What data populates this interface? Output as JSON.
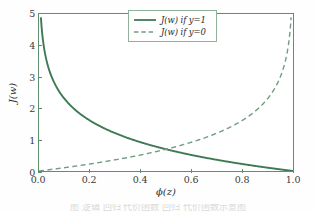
{
  "figure": {
    "background_color": "#fefefe",
    "accent_color": "#3f7a55",
    "frame_color": "#5f8f6f"
  },
  "axes": {
    "x_title": "ϕ(z)",
    "y_title": "J(w)",
    "x_tick_labels": [
      "0.0",
      "0.2",
      "0.4",
      "0.6",
      "0.8",
      "1.0"
    ],
    "y_tick_labels": [
      "0",
      "1",
      "2",
      "3",
      "4",
      "5"
    ]
  },
  "legend": {
    "entries": [
      {
        "label": "J(w) if y=1",
        "style": "solid"
      },
      {
        "label": "J(w) if y=0",
        "style": "dashed"
      }
    ]
  },
  "caption": {
    "text": "图    逻辑   回归   代价函数   回归   代价函数示意图"
  },
  "chart_data": {
    "type": "line",
    "title": "",
    "xlabel": "ϕ(z)",
    "ylabel": "J(w)",
    "xlim": [
      0.0,
      1.0
    ],
    "ylim": [
      0.0,
      5.0
    ],
    "xticks": [
      0.0,
      0.2,
      0.4,
      0.6,
      0.8,
      1.0
    ],
    "yticks": [
      0,
      1,
      2,
      3,
      4,
      5
    ],
    "grid": false,
    "legend_position": "upper center",
    "series": [
      {
        "name": "J(w) if y=1",
        "style": "solid",
        "color": "#3f7a55",
        "formula": "-log(phi(z))",
        "x": [
          0.007,
          0.02,
          0.04,
          0.06,
          0.08,
          0.1,
          0.12,
          0.15,
          0.2,
          0.25,
          0.3,
          0.35,
          0.4,
          0.45,
          0.5,
          0.55,
          0.6,
          0.65,
          0.7,
          0.75,
          0.8,
          0.85,
          0.9,
          0.95,
          1.0
        ],
        "y": [
          4.96,
          3.91,
          3.22,
          2.81,
          2.53,
          2.3,
          2.12,
          1.9,
          1.61,
          1.39,
          1.2,
          1.05,
          0.92,
          0.8,
          0.69,
          0.6,
          0.51,
          0.43,
          0.36,
          0.29,
          0.22,
          0.16,
          0.11,
          0.05,
          0.0
        ]
      },
      {
        "name": "J(w) if y=0",
        "style": "dashed",
        "color": "#6f9e80",
        "formula": "-log(1 - phi(z))",
        "x": [
          0.0,
          0.05,
          0.1,
          0.15,
          0.2,
          0.25,
          0.3,
          0.35,
          0.4,
          0.45,
          0.5,
          0.55,
          0.6,
          0.65,
          0.7,
          0.75,
          0.8,
          0.85,
          0.88,
          0.9,
          0.92,
          0.94,
          0.96,
          0.98,
          0.993
        ],
        "y": [
          0.0,
          0.05,
          0.11,
          0.16,
          0.22,
          0.29,
          0.36,
          0.43,
          0.51,
          0.6,
          0.69,
          0.8,
          0.92,
          1.05,
          1.2,
          1.39,
          1.61,
          1.9,
          2.12,
          2.3,
          2.53,
          2.81,
          3.22,
          3.91,
          4.96
        ]
      }
    ]
  }
}
